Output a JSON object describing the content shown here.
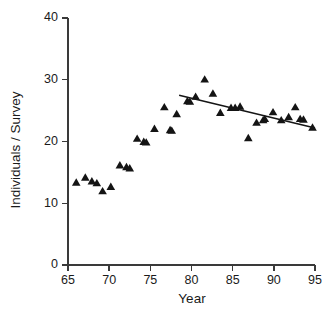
{
  "chart_data": {
    "type": "scatter",
    "title": "",
    "xlabel": "Year",
    "ylabel": "Individuals / Survey",
    "xlim": [
      65,
      95
    ],
    "ylim": [
      0,
      40
    ],
    "xticks": [
      65,
      70,
      75,
      80,
      85,
      90,
      95
    ],
    "yticks": [
      0,
      10,
      20,
      30,
      40
    ],
    "xtick_labels": [
      "65",
      "70",
      "75",
      "80",
      "85",
      "90",
      "95"
    ],
    "ytick_labels": [
      "0",
      "10",
      "20",
      "30",
      "40"
    ],
    "grid": false,
    "legend": null,
    "marker": "triangle-up",
    "marker_color": "#141414",
    "axis_color": "#3a3a3a",
    "trendline_color": "#151515",
    "series": [
      {
        "name": "Individuals per Survey",
        "points": [
          {
            "x": 66.0,
            "y": 13.3
          },
          {
            "x": 67.1,
            "y": 14.1
          },
          {
            "x": 67.9,
            "y": 13.5
          },
          {
            "x": 68.5,
            "y": 13.2
          },
          {
            "x": 69.2,
            "y": 11.9
          },
          {
            "x": 70.2,
            "y": 12.6
          },
          {
            "x": 71.3,
            "y": 16.1
          },
          {
            "x": 72.1,
            "y": 15.8
          },
          {
            "x": 72.5,
            "y": 15.6
          },
          {
            "x": 73.4,
            "y": 20.4
          },
          {
            "x": 74.2,
            "y": 19.9
          },
          {
            "x": 74.5,
            "y": 19.8
          },
          {
            "x": 75.5,
            "y": 22.0
          },
          {
            "x": 76.7,
            "y": 25.5
          },
          {
            "x": 77.4,
            "y": 21.8
          },
          {
            "x": 77.6,
            "y": 21.7
          },
          {
            "x": 78.2,
            "y": 24.4
          },
          {
            "x": 79.5,
            "y": 26.5
          },
          {
            "x": 79.8,
            "y": 26.4
          },
          {
            "x": 80.5,
            "y": 27.2
          },
          {
            "x": 81.6,
            "y": 30.0
          },
          {
            "x": 82.6,
            "y": 27.7
          },
          {
            "x": 83.5,
            "y": 24.6
          },
          {
            "x": 84.8,
            "y": 25.4
          },
          {
            "x": 85.3,
            "y": 25.4
          },
          {
            "x": 85.9,
            "y": 25.6
          },
          {
            "x": 86.9,
            "y": 20.5
          },
          {
            "x": 87.9,
            "y": 23.0
          },
          {
            "x": 88.7,
            "y": 23.4
          },
          {
            "x": 88.9,
            "y": 23.6
          },
          {
            "x": 89.9,
            "y": 24.7
          },
          {
            "x": 90.9,
            "y": 23.4
          },
          {
            "x": 91.8,
            "y": 23.9
          },
          {
            "x": 92.6,
            "y": 25.5
          },
          {
            "x": 93.2,
            "y": 23.6
          },
          {
            "x": 93.6,
            "y": 23.5
          },
          {
            "x": 94.7,
            "y": 22.2
          }
        ]
      }
    ],
    "trendline": {
      "name": "linear-fit-1979-1995",
      "x_start": 78.5,
      "y_start": 27.5,
      "x_end": 95.0,
      "y_end": 22.2
    }
  }
}
